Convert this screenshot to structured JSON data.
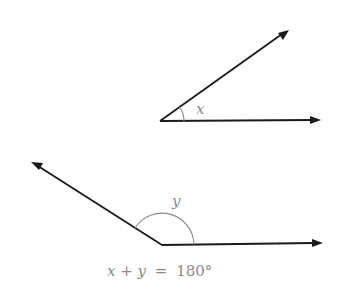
{
  "figure": {
    "angle_x": {
      "label": "x",
      "vertex": [
        160,
        121
      ],
      "ray1_tip": [
        289,
        30
      ],
      "ray2_tip": [
        321,
        120
      ]
    },
    "angle_y": {
      "label": "y",
      "vertex": [
        162,
        245
      ],
      "ray1_tip": [
        31,
        162
      ],
      "ray2_tip": [
        323,
        243
      ]
    },
    "equation": {
      "left": "x + y",
      "equals": "=",
      "right": "180°",
      "full": "x + y = 180°"
    },
    "colors": {
      "ray": "#1a1a1a",
      "arc": "#8a8a8a",
      "text": "#8a8a8a"
    }
  }
}
